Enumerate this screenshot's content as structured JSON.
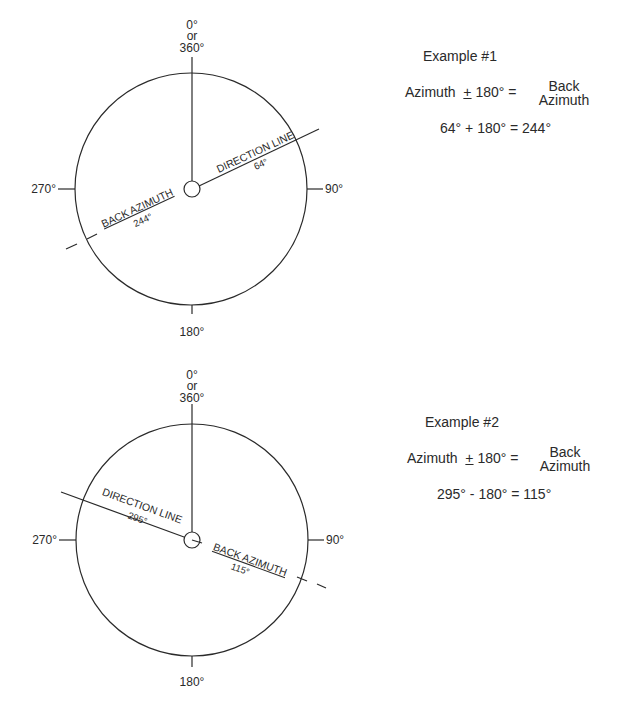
{
  "figure": {
    "diagrams": [
      {
        "id": "example-1",
        "compass_labels": {
          "north_1": "0°",
          "north_2": "or",
          "north_3": "360°",
          "east": "90°",
          "south": "180°",
          "west": "270°"
        },
        "direction_line": {
          "label": "DIRECTION LINE",
          "degrees": "64°",
          "azimuth": 64
        },
        "back_azimuth": {
          "label": "BACK AZIMUTH",
          "degrees": "244°",
          "azimuth": 244
        }
      },
      {
        "id": "example-2",
        "compass_labels": {
          "north_1": "0°",
          "north_2": "or",
          "north_3": "360°",
          "east": "90°",
          "south": "180°",
          "west": "270°"
        },
        "direction_line": {
          "label": "DIRECTION LINE",
          "degrees": "295°",
          "azimuth": 295
        },
        "back_azimuth": {
          "label": "BACK AZIMUTH",
          "degrees": "115°",
          "azimuth": 115
        }
      }
    ],
    "examples": [
      {
        "title": "Example #1",
        "formula_left": "Azimuth",
        "formula_pm": "+",
        "formula_mid": "180° =",
        "formula_right_top": "Back",
        "formula_right_bottom": "Azimuth",
        "calculation": "64° + 180° = 244°"
      },
      {
        "title": "Example #2",
        "formula_left": "Azimuth",
        "formula_pm": "+",
        "formula_mid": "180° =",
        "formula_right_top": "Back",
        "formula_right_bottom": "Azimuth",
        "calculation": "295° - 180° = 115°"
      }
    ]
  }
}
